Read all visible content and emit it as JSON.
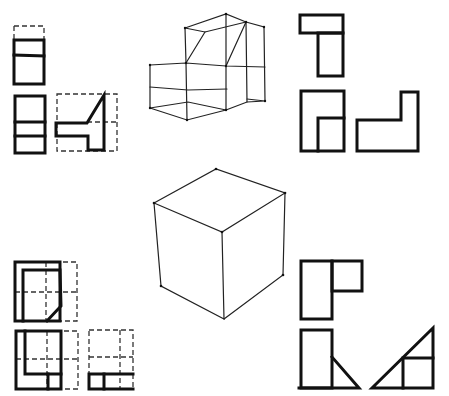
{
  "diagram": {
    "title": "",
    "type": "orthographic projection sketches",
    "colors": {
      "background": "#ffffff",
      "ink": "#111111"
    },
    "groups": [
      {
        "id": "top-left",
        "description": "three orthographic views with dashed bounding boxes (top, front, side) of the stepped object"
      },
      {
        "id": "top-center",
        "description": "isometric wireframe of stepped block with sloped face"
      },
      {
        "id": "top-right",
        "description": "three solid orthographic views: T-shape top, L-notched front, L-shape side"
      },
      {
        "id": "center",
        "description": "isometric cube sketch"
      },
      {
        "id": "bottom-left",
        "description": "three views with dashed grid guides of a chamfered object"
      },
      {
        "id": "bottom-right",
        "description": "three views: L-shaped top, front with triangle, side right triangle"
      }
    ]
  }
}
